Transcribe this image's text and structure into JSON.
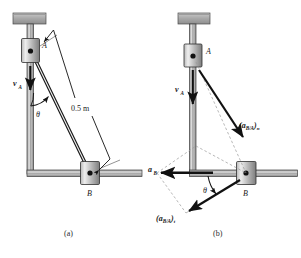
{
  "figure": {
    "type": "engineering-mechanics-diagram",
    "background_color": "#ffffff",
    "ink_color": "#1a1a1a",
    "metal_fill_light": "#d8d8d8",
    "metal_fill_dark": "#8c8c8c",
    "dashed_color": "#9a9a9a"
  },
  "panel_a": {
    "caption": "(a)",
    "labels": {
      "collar_a": "A",
      "collar_b": "B",
      "velocity_a": "v",
      "velocity_a_sub": "A",
      "angle": "θ",
      "length": "0.5 m"
    },
    "geometry": {
      "link_length_label": "0.5 m",
      "collar_a_position": [
        31,
        51
      ],
      "collar_b_position": [
        90,
        173
      ],
      "angle_symbol": "theta",
      "vertical_guide": "collar A slides on vertical rail",
      "horizontal_guide": "collar B slides on horizontal rail"
    }
  },
  "panel_b": {
    "caption": "(b)",
    "labels": {
      "collar_a": "A",
      "collar_b": "B",
      "velocity_a": "v",
      "velocity_a_sub": "A",
      "accel_b": "a",
      "accel_b_sub": "B",
      "accel_rel_normal_open": "(",
      "accel_rel_normal_main": "a",
      "accel_rel_normal_sub": "B/A",
      "accel_rel_normal_close": ")",
      "accel_rel_normal_comp": "n",
      "accel_rel_tangential_open": "(",
      "accel_rel_tangential_main": "a",
      "accel_rel_tangential_sub": "B/A",
      "accel_rel_tangential_close": ")",
      "accel_rel_tangential_comp": "t",
      "angle": "θ"
    },
    "vectors": [
      {
        "name": "v_A",
        "label": "v_A",
        "direction": "downward along vertical guide",
        "from": [
          193,
          63
        ],
        "to": [
          193,
          105
        ]
      },
      {
        "name": "a_B",
        "label": "a_B",
        "direction": "horizontal to the left",
        "from": [
          213,
          173
        ],
        "to": [
          157,
          173
        ]
      },
      {
        "name": "(a_B/A)_n",
        "label": "(a_B/A)_n",
        "direction": "from A toward B along link",
        "from": [
          199,
          70
        ],
        "to": [
          244,
          135
        ]
      },
      {
        "name": "(a_B/A)_t",
        "label": "(a_B/A)_t",
        "direction": "perpendicular to link, down-left",
        "from": [
          240,
          180
        ],
        "to": [
          186,
          213
        ]
      }
    ],
    "geometry": {
      "collar_a_position": [
        193,
        56
      ],
      "collar_b_position": [
        246,
        173
      ],
      "angle_symbol": "theta",
      "construction": "dashed parallelogram closing the vector triangle"
    }
  }
}
